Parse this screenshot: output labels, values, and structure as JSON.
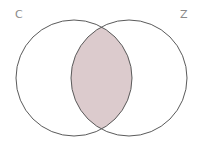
{
  "diagram": {
    "type": "venn",
    "sets": [
      {
        "label": "C",
        "cx": 74,
        "cy": 78,
        "r": 58
      },
      {
        "label": "Z",
        "cx": 129,
        "cy": 78,
        "r": 58
      }
    ],
    "shaded_region": "C ∩ Z",
    "colors": {
      "stroke": "#5a5a5a",
      "fill": "#dccbcd",
      "label": "#8a8a8a",
      "background": "#ffffff"
    }
  }
}
